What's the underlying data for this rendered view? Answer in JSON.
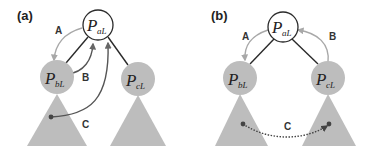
{
  "colors": {
    "node_fill": "#bdbdbd",
    "root_fill": "#ffffff",
    "tree_edge": "#2a2a2a",
    "arrow_gray": "#a8a8a8",
    "arrow_dark": "#555555",
    "dotted_arrow": "#444444"
  },
  "panels": [
    {
      "label": "(a)",
      "root": {
        "main": "P",
        "sub": "aL"
      },
      "left": {
        "main": "P",
        "sub": "bL"
      },
      "right": {
        "main": "P",
        "sub": "cL"
      },
      "arrows": [
        {
          "label": "A",
          "from": "root",
          "to": "left",
          "style": "gray-solid"
        },
        {
          "label": "B",
          "from": "left",
          "to": "root",
          "style": "dark-solid"
        },
        {
          "label": "C",
          "from": "left-subtree",
          "to": "root",
          "style": "dark-solid"
        }
      ]
    },
    {
      "label": "(b)",
      "root": {
        "main": "P",
        "sub": "aL"
      },
      "left": {
        "main": "P",
        "sub": "bL"
      },
      "right": {
        "main": "P",
        "sub": "cL"
      },
      "arrows": [
        {
          "label": "A",
          "from": "root",
          "to": "left",
          "style": "gray-solid"
        },
        {
          "label": "B",
          "from": "right",
          "to": "root",
          "style": "gray-solid"
        },
        {
          "label": "C",
          "from": "left-subtree",
          "to": "right-subtree",
          "style": "dark-dotted"
        }
      ]
    }
  ]
}
